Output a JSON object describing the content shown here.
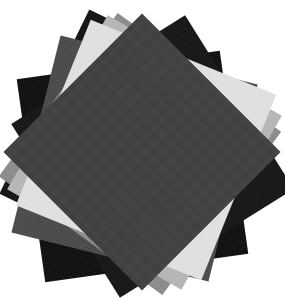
{
  "canvas": {
    "width": 285,
    "height": 301,
    "background_color": "#ffffff",
    "subject": "fanned stack of square paper swatches",
    "alt_text": "A stack of square paper sheets rotated at different angles, fanned so the corners of each lower sheet show around the dark charcoal square on top."
  },
  "stack": {
    "count": 8,
    "center_x": 142,
    "center_y": 152,
    "description": "Eight square sheets in grayscale, each rotated a different amount about the common center; the darkest sheet sits on top.",
    "sheets": [
      {
        "index": 1,
        "name": "sheet-black-lower-left",
        "tone": "black",
        "color": "#0d0d0d",
        "size": 205,
        "rotation_deg": -8,
        "offset_x": -10,
        "offset_y": 14,
        "z": 1
      },
      {
        "index": 2,
        "name": "sheet-black-upper-left",
        "tone": "black",
        "color": "#111111",
        "size": 205,
        "rotation_deg": 26,
        "offset_x": -6,
        "offset_y": -6,
        "z": 2
      },
      {
        "index": 3,
        "name": "sheet-black-right",
        "tone": "black",
        "color": "#141414",
        "size": 205,
        "rotation_deg": 58,
        "offset_x": 10,
        "offset_y": 4,
        "z": 3
      },
      {
        "index": 4,
        "name": "sheet-dark-gray",
        "tone": "dark-gray",
        "color": "#4a4a4a",
        "size": 203,
        "rotation_deg": 14,
        "offset_x": -8,
        "offset_y": 6,
        "z": 4
      },
      {
        "index": 5,
        "name": "sheet-mid-gray",
        "tone": "mid-gray",
        "color": "#8e8e8e",
        "size": 202,
        "rotation_deg": 36,
        "offset_x": -2,
        "offset_y": 2,
        "z": 5
      },
      {
        "index": 6,
        "name": "sheet-light-gray",
        "tone": "light-gray",
        "color": "#b9b9b9",
        "size": 201,
        "rotation_deg": 30,
        "offset_x": 2,
        "offset_y": 0,
        "z": 6
      },
      {
        "index": 7,
        "name": "sheet-near-white",
        "tone": "near-white",
        "color": "#e4e4e4",
        "size": 200,
        "rotation_deg": 22,
        "offset_x": 4,
        "offset_y": -2,
        "z": 7
      },
      {
        "index": 8,
        "name": "sheet-charcoal-top",
        "tone": "charcoal",
        "color": "#3f3f3f",
        "size": 196,
        "rotation_deg": 45,
        "offset_x": 0,
        "offset_y": 0,
        "z": 8
      }
    ]
  }
}
